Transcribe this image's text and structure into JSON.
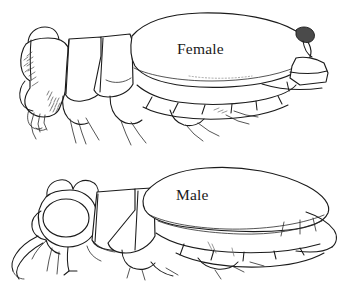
{
  "figure": {
    "type": "scientific-line-drawing",
    "background_color": "#ffffff",
    "ink_color": "#1b1b1b",
    "width": 345,
    "height": 281,
    "panels": [
      {
        "id": "female",
        "label": "Female",
        "position": "top",
        "label_x": 177,
        "label_y": 41,
        "description": "Lateral view of female with greatly enlarged rounded abdomen, small eye, hatched head markings and short cerci"
      },
      {
        "id": "male",
        "label": "Male",
        "position": "bottom",
        "label_x": 176,
        "label_y": 187,
        "description": "Lateral view of male with large circular compound eye, elongate tapering elytron and projecting mandible"
      }
    ]
  }
}
